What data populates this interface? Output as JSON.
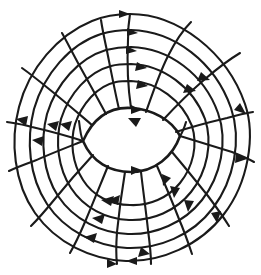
{
  "figure": {
    "title": "Concentric streamline flow field with central lens separatrix",
    "background_color": "#ffffff",
    "stroke_color": "#1a1a1a",
    "canvas": {
      "width": 261,
      "height": 275
    }
  },
  "chart_data": {
    "type": "line",
    "title": "Concentric streamline flow field with central lens separatrix",
    "subtitle": "",
    "xlabel": "",
    "ylabel": "",
    "grid": false,
    "legend_position": "none",
    "xlim": [
      0,
      261
    ],
    "ylim": [
      0,
      275
    ],
    "center": {
      "x": 130,
      "y": 139
    },
    "core_lens": {
      "name": "central separatrix lens",
      "left_point": {
        "x": 83,
        "y": 141
      },
      "right_point": {
        "x": 180,
        "y": 136
      },
      "top_apex": {
        "x": 131,
        "y": 108
      },
      "bottom_apex": {
        "x": 131,
        "y": 172
      },
      "arrow_directions": [
        "right-on-top",
        "right-on-bottom"
      ]
    },
    "series": [
      {
        "name": "ring-1-outermost",
        "kind": "closed-streamline",
        "radius_x": 119,
        "radius_y": 125,
        "arrow_count": 5
      },
      {
        "name": "ring-2",
        "kind": "closed-streamline",
        "radius_x": 104,
        "radius_y": 109,
        "arrow_count": 5
      },
      {
        "name": "ring-3",
        "kind": "closed-streamline",
        "radius_x": 88,
        "radius_y": 92,
        "arrow_count": 5
      },
      {
        "name": "ring-4",
        "kind": "closed-streamline",
        "radius_x": 72,
        "radius_y": 75,
        "arrow_count": 4
      },
      {
        "name": "ring-5-innermost",
        "kind": "closed-streamline",
        "radius_x": 56,
        "radius_y": 58,
        "arrow_count": 4
      }
    ],
    "radial_trajectories": {
      "count": 12,
      "kind": "curved-spiral-spokes",
      "sweep": "clockwise-trailing",
      "angles_deg": [
        0,
        30,
        60,
        90,
        120,
        150,
        180,
        210,
        240,
        270,
        300,
        330
      ]
    },
    "arrow_markers": {
      "total": 24,
      "shape": "solid-triangle",
      "length": 9,
      "width": 7
    },
    "annotations": []
  }
}
